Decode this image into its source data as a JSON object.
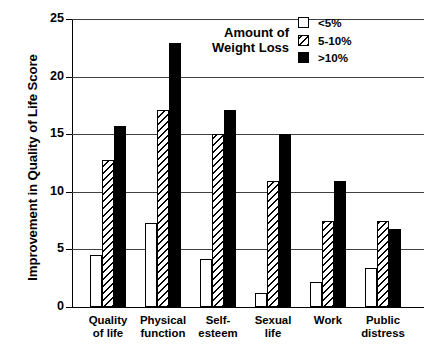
{
  "chart_data": {
    "type": "bar",
    "title": "",
    "xlabel": "",
    "ylabel": "Improvement in Quality of Life Score",
    "ylim": [
      0,
      25
    ],
    "yticks": [
      0,
      5,
      10,
      15,
      20,
      25
    ],
    "grid": true,
    "legend_position": "top-right",
    "legend_title": "Amount of Weight Loss",
    "categories": [
      "Quality of life",
      "Physical function",
      "Self-esteem",
      "Sexual life",
      "Work",
      "Public distress"
    ],
    "category_lines": [
      [
        "Quality",
        "of life"
      ],
      [
        "Physical",
        "function"
      ],
      [
        "Self-",
        "esteem"
      ],
      [
        "Sexual",
        "life"
      ],
      [
        "Work",
        ""
      ],
      [
        "Public",
        "distress"
      ]
    ],
    "series": [
      {
        "name": "<5%",
        "fill": "white",
        "values": [
          4.5,
          7.3,
          4.2,
          1.2,
          2.2,
          3.4
        ]
      },
      {
        "name": "5-10%",
        "fill": "hatch",
        "values": [
          12.8,
          17.1,
          15.0,
          10.9,
          7.5,
          7.5
        ]
      },
      {
        "name": ">10%",
        "fill": "black",
        "values": [
          15.7,
          22.9,
          17.1,
          15.0,
          10.9,
          6.8
        ]
      }
    ]
  },
  "legend": {
    "title_line1": "Amount of",
    "title_line2": "Weight Loss",
    "items": [
      {
        "label": "<5%",
        "fill": "white"
      },
      {
        "label": "5-10%",
        "fill": "hatch"
      },
      {
        "label": ">10%",
        "fill": "black"
      }
    ]
  },
  "axis": {
    "y_title": "Improvement in Quality of Life Score",
    "y_tick_labels": [
      "0",
      "5",
      "10",
      "15",
      "20",
      "25"
    ]
  }
}
